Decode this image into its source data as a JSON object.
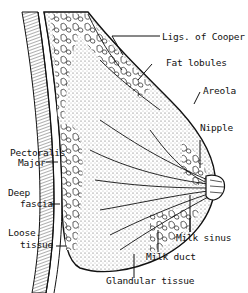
{
  "diagram": {
    "type": "anatomical cross-section",
    "style": "black and white line engraving",
    "labels": {
      "ligs_cooper": "Ligs. of Cooper",
      "fat_lobules": "Fat lobules",
      "areola": "Areola",
      "nipple": "Nipple",
      "pectoralis_1": "Pectoralis",
      "pectoralis_2": "Major",
      "deep_fascia_1": "Deep",
      "deep_fascia_2": "fascia",
      "loose_tissue_1": "Loose.",
      "loose_tissue_2": "tissue",
      "milk_sinus": "Milk sinus",
      "milk_duct": "Milk duct",
      "glandular_tissue": "Glandular tissue"
    },
    "colors": {
      "ink": "#111111",
      "background": "#ffffff",
      "stipple": "#8a8a8a"
    }
  }
}
